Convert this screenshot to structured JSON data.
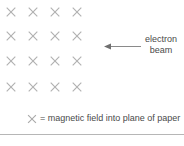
{
  "figure": {
    "background_color": "#ffffff"
  },
  "field_grid": {
    "symbol": "x-cross-icon",
    "symbol_char": "✕",
    "rows": 4,
    "columns": 4,
    "color": "#b0b0b0",
    "positions": [
      {
        "x": 11,
        "y": 12
      },
      {
        "x": 33,
        "y": 12
      },
      {
        "x": 55,
        "y": 12
      },
      {
        "x": 77,
        "y": 12
      },
      {
        "x": 11,
        "y": 36
      },
      {
        "x": 33,
        "y": 36
      },
      {
        "x": 55,
        "y": 36
      },
      {
        "x": 77,
        "y": 36
      },
      {
        "x": 11,
        "y": 61
      },
      {
        "x": 33,
        "y": 61
      },
      {
        "x": 55,
        "y": 61
      },
      {
        "x": 77,
        "y": 61
      },
      {
        "x": 11,
        "y": 87
      },
      {
        "x": 33,
        "y": 87
      },
      {
        "x": 55,
        "y": 87
      },
      {
        "x": 77,
        "y": 87
      }
    ]
  },
  "beam": {
    "arrow_direction": "left",
    "arrow_color": "#8a8a8a",
    "label_line1": "electron",
    "label_line2": "beam",
    "label_color": "#4a4a4a"
  },
  "caption": {
    "symbol": "✕",
    "text": "= magnetic field into plane of paper",
    "color": "#4a4a4a"
  },
  "rule": {
    "color": "#b6b6b6"
  }
}
